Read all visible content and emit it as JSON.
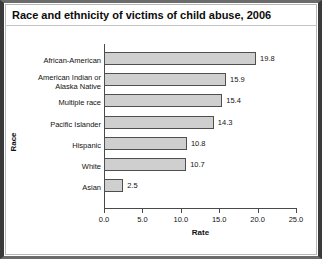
{
  "chart": {
    "title": "Race and ethnicity of victims of child abuse, 2006"
  },
  "chart_data": {
    "type": "bar",
    "orientation": "horizontal",
    "title": "Race and ethnicity of victims of child abuse, 2006",
    "xlabel": "Rate",
    "ylabel": "Race",
    "categories": [
      "African-American",
      "American Indian or\nAlaska Native",
      "Multiple race",
      "Pacific Islander",
      "Hispanic",
      "White",
      "Asian"
    ],
    "values": [
      19.8,
      15.9,
      15.4,
      14.3,
      10.8,
      10.7,
      2.5
    ],
    "value_labels": [
      "19.8",
      "15.9",
      "15.4",
      "14.3",
      "10.8",
      "10.7",
      "2.5"
    ],
    "xlim": [
      0.0,
      25.0
    ],
    "xticks": [
      0.0,
      5.0,
      10.0,
      15.0,
      20.0,
      25.0
    ],
    "xtick_labels": [
      "0.0",
      "5.0",
      "10.0",
      "15.0",
      "20.0",
      "25.0"
    ],
    "grid": false,
    "legend": null,
    "bar_fill_color": "#cfcfcf",
    "bar_edge_color": "#4f4f4f",
    "axis_color": "#4a4a4a"
  }
}
